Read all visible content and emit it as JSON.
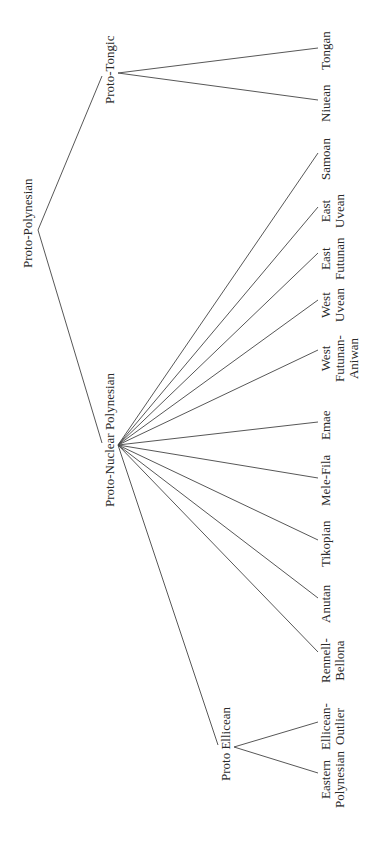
{
  "diagram": {
    "type": "tree",
    "orientation": "rotated-90-ccw",
    "root": {
      "label": "Proto-Polynesian",
      "children": [
        {
          "label": "Proto-Tongic",
          "children": [
            {
              "label": "Tongan"
            },
            {
              "label": "Niuean"
            }
          ]
        },
        {
          "label": "Proto-Nuclear Polynesian",
          "children": [
            {
              "label": "Samoan"
            },
            {
              "label": "East Uvean",
              "lines": [
                "East",
                "Uvean"
              ]
            },
            {
              "label": "East Futunan",
              "lines": [
                "East",
                "Futunan"
              ]
            },
            {
              "label": "West Uvean",
              "lines": [
                "West",
                "Uvean"
              ]
            },
            {
              "label": "West Futunan-Aniwan",
              "lines": [
                "West",
                "Futunan-",
                "Aniwan"
              ]
            },
            {
              "label": "Emae"
            },
            {
              "label": "Mele-Fila"
            },
            {
              "label": "Tikopian"
            },
            {
              "label": "Anutan"
            },
            {
              "label": "Rennell-Bellona",
              "lines": [
                "Rennell-",
                "Bellona"
              ]
            },
            {
              "label": "Proto Ellicean",
              "children": [
                {
                  "label": "Ellicean-Outlier",
                  "lines": [
                    "Ellicean-",
                    "Outlier"
                  ]
                },
                {
                  "label": "Eastern Polynesian",
                  "lines": [
                    "Eastern",
                    "Polynesian"
                  ]
                }
              ]
            }
          ]
        }
      ]
    }
  },
  "labels": {
    "proto_polynesian": "Proto-Polynesian",
    "proto_tongic": "Proto-Tongic",
    "proto_nuclear_polynesian": "Proto-Nuclear Polynesian",
    "proto_ellicean": "Proto Ellicean",
    "tongan": "Tongan",
    "niuean": "Niuean",
    "samoan": "Samoan",
    "east_uvean": [
      "East",
      "Uvean"
    ],
    "east_futunan": [
      "East",
      "Futunan"
    ],
    "west_uvean": [
      "West",
      "Uvean"
    ],
    "west_futunan_aniwan": [
      "West",
      "Futunan-",
      "Aniwan"
    ],
    "emae": "Emae",
    "mele_fila": "Mele-Fila",
    "tikopian": "Tikopian",
    "anutan": "Anutan",
    "rennell_bellona": [
      "Rennell-",
      "Bellona"
    ],
    "ellicean_outlier": [
      "Ellicean-",
      "Outlier"
    ],
    "eastern_polynesian": [
      "Eastern",
      "Polynesian"
    ]
  }
}
